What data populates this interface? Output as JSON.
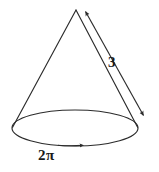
{
  "figure": {
    "kind": "geometry-diagram",
    "width": 159,
    "height": 172,
    "background_color": "#ffffff",
    "stroke_color": "#2b2b2b",
    "text_color": "#1a1a1a"
  },
  "labels": {
    "slant_height": "3",
    "circumference": "2π"
  },
  "annotations": {
    "slant_height_label_name": "slant-height-measure",
    "circumference_label_name": "base-circumference-measure"
  },
  "geometry": {
    "apex": {
      "x": 76,
      "y": 10
    },
    "base_ellipse": {
      "cx": 75,
      "cy": 128,
      "rx": 63,
      "ry": 18
    },
    "left_slant": {
      "x1": 76,
      "y1": 10,
      "x2": 12,
      "y2": 128
    },
    "right_slant": {
      "x1": 76,
      "y1": 10,
      "x2": 138,
      "y2": 128
    },
    "dimension_line": {
      "x1": 84,
      "y1": 12,
      "x2": 145,
      "y2": 117
    }
  }
}
